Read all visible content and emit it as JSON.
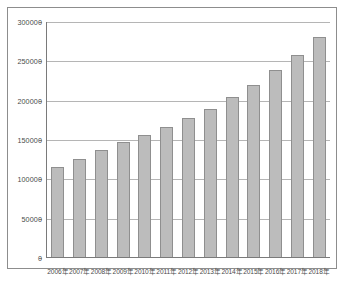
{
  "chart_data": {
    "type": "bar",
    "title": "",
    "subtitle": "",
    "xlabel": "",
    "ylabel": "",
    "categories": [
      "2006年",
      "2007年",
      "2008年",
      "2009年",
      "2010年",
      "2011年",
      "2012年",
      "2013年",
      "2014年",
      "2015年",
      "2016年",
      "2017年",
      "2018年"
    ],
    "values": [
      114000,
      125000,
      136000,
      146000,
      155000,
      165000,
      177000,
      188000,
      203000,
      219000,
      238000,
      257000,
      280000
    ],
    "series": [
      {
        "name": "",
        "values": [
          114000,
          125000,
          136000,
          146000,
          155000,
          165000,
          177000,
          188000,
          203000,
          219000,
          238000,
          257000,
          280000
        ]
      }
    ],
    "ylim": [
      0,
      300000
    ],
    "yticks": [
      0,
      50000,
      100000,
      150000,
      200000,
      250000,
      300000
    ],
    "ytick_labels": [
      "0",
      "50000",
      "100000",
      "150000",
      "200000",
      "250000",
      "300000"
    ],
    "grid": true,
    "grid_axis": "y",
    "legend": false,
    "legend_position": "none",
    "bar_color": "#bcbcbc",
    "bar_edge_color": "#8f8f8f",
    "gridline_color": "#b5b5b5",
    "axis_color": "#7a7a7a",
    "frame_color": "#8d8d8d",
    "background_color": "#ffffff"
  },
  "caption": ""
}
